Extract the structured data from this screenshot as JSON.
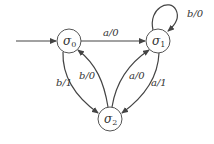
{
  "diagram": {
    "type": "finite-state-machine",
    "states": [
      {
        "id": "s0",
        "label": "σ",
        "subscript": "0",
        "initial": true
      },
      {
        "id": "s1",
        "label": "σ",
        "subscript": "1"
      },
      {
        "id": "s2",
        "label": "σ",
        "subscript": "2"
      }
    ],
    "transitions": [
      {
        "from": "s0",
        "to": "s1",
        "label": "a/0"
      },
      {
        "from": "s1",
        "to": "s1",
        "label": "b/0"
      },
      {
        "from": "s0",
        "to": "s2",
        "label": "b/1"
      },
      {
        "from": "s2",
        "to": "s0",
        "label": "b/0"
      },
      {
        "from": "s2",
        "to": "s1",
        "label": "a/0"
      },
      {
        "from": "s1",
        "to": "s2",
        "label": "a/1"
      }
    ]
  }
}
